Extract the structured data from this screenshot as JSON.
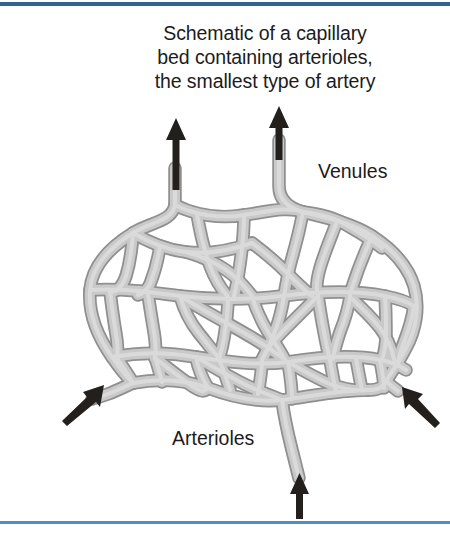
{
  "figure": {
    "caption_lines": [
      "Schematic of a capillary",
      "bed containing arterioles,",
      "the smallest type of artery"
    ],
    "labels": {
      "venules": "Venules",
      "arterioles": "Arterioles"
    },
    "colors": {
      "rule_top": "#2e6593",
      "rule_bottom": "#4a90c4",
      "vessel_fill": "#c6c6c6",
      "vessel_stroke": "#8f8f8f",
      "arrow": "#231f1c",
      "text": "#1c1c1c",
      "background": "#ffffff"
    },
    "arrows": {
      "venule_left": "arrow-up-icon",
      "venule_right": "arrow-up-icon",
      "arteriole_left": "arrow-up-right-icon",
      "arteriole_right": "arrow-up-left-icon",
      "arteriole_bottom": "arrow-up-icon"
    },
    "diagram_name": "capillary-bed-schematic"
  }
}
